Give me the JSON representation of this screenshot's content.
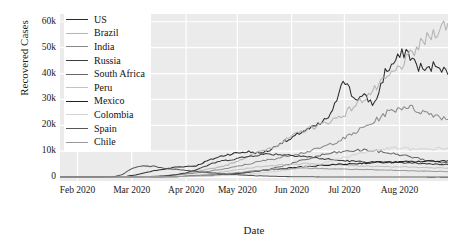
{
  "chart_data": {
    "type": "line",
    "title": "",
    "xlabel": "Date",
    "ylabel": "Recovered Cases",
    "grid": true,
    "legend_position": "upper-left-inside",
    "xlim": [
      "2020-01-22",
      "2020-08-28"
    ],
    "ylim": [
      -1500,
      63000
    ],
    "yticks": [
      0,
      10000,
      20000,
      30000,
      40000,
      50000,
      60000
    ],
    "ytick_labels": [
      "0",
      "10k",
      "20k",
      "30k",
      "40k",
      "50k",
      "60k"
    ],
    "xticks": [
      "Feb 2020",
      "Mar 2020",
      "Apr 2020",
      "May 2020",
      "Jun 2020",
      "Jul 2020",
      "Aug 2020"
    ],
    "x": [
      "2020-01-22",
      "2020-02-01",
      "2020-02-11",
      "2020-02-21",
      "2020-03-02",
      "2020-03-12",
      "2020-03-22",
      "2020-04-01",
      "2020-04-06",
      "2020-04-11",
      "2020-04-16",
      "2020-04-21",
      "2020-04-26",
      "2020-05-01",
      "2020-05-06",
      "2020-05-11",
      "2020-05-16",
      "2020-05-21",
      "2020-05-26",
      "2020-05-31",
      "2020-06-05",
      "2020-06-10",
      "2020-06-15",
      "2020-06-20",
      "2020-06-25",
      "2020-06-30",
      "2020-07-05",
      "2020-07-10",
      "2020-07-15",
      "2020-07-20",
      "2020-07-25",
      "2020-07-30",
      "2020-08-04",
      "2020-08-09",
      "2020-08-14",
      "2020-08-19",
      "2020-08-24",
      "2020-08-28"
    ],
    "series": [
      {
        "name": "US",
        "color": "#2b2b2b",
        "values": [
          0,
          0,
          0,
          0,
          0,
          0,
          100,
          700,
          1600,
          2500,
          3100,
          3900,
          4100,
          4400,
          6200,
          7600,
          8800,
          9400,
          9800,
          9200,
          10400,
          13200,
          14500,
          17500,
          18900,
          21000,
          24900,
          38800,
          30500,
          30900,
          28200,
          40500,
          44800,
          48900,
          43200,
          41000,
          44200,
          39500
        ]
      },
      {
        "name": "Brazil",
        "color": "#b4b4b4",
        "values": [
          0,
          0,
          0,
          0,
          0,
          0,
          0,
          50,
          120,
          250,
          400,
          900,
          1400,
          2100,
          2900,
          3800,
          4700,
          6400,
          8100,
          9800,
          11200,
          13000,
          15400,
          17500,
          19200,
          20400,
          22100,
          24000,
          27300,
          30500,
          33800,
          37500,
          41000,
          45000,
          49500,
          53500,
          57000,
          59500
        ]
      },
      {
        "name": "India",
        "color": "#8a8a8a",
        "values": [
          0,
          0,
          0,
          0,
          0,
          0,
          10,
          60,
          180,
          350,
          600,
          900,
          1200,
          1600,
          2100,
          2800,
          3400,
          4200,
          5100,
          6000,
          6800,
          7500,
          8600,
          9300,
          10200,
          11500,
          13100,
          14700,
          16900,
          19200,
          21500,
          24500,
          26200,
          27500,
          25900,
          24800,
          23900,
          22200
        ]
      },
      {
        "name": "Russia",
        "color": "#3c3c3c",
        "values": [
          0,
          0,
          0,
          0,
          0,
          0,
          0,
          20,
          80,
          180,
          400,
          900,
          1700,
          2900,
          4400,
          5900,
          6600,
          7300,
          8000,
          8700,
          8900,
          8800,
          8500,
          8200,
          7700,
          7100,
          6700,
          6400,
          6100,
          5900,
          5800,
          5700,
          5600,
          5500,
          5400,
          5200,
          5000,
          4800
        ]
      },
      {
        "name": "South Africa",
        "color": "#666666",
        "values": [
          0,
          0,
          0,
          0,
          0,
          0,
          0,
          5,
          20,
          50,
          100,
          180,
          260,
          350,
          520,
          720,
          950,
          1300,
          1800,
          2400,
          3100,
          4100,
          5200,
          6300,
          7400,
          8600,
          9300,
          9800,
          10200,
          10500,
          10100,
          9500,
          8900,
          8200,
          7400,
          6500,
          5900,
          5400
        ]
      },
      {
        "name": "Peru",
        "color": "#c2c2c2",
        "values": [
          0,
          0,
          0,
          0,
          0,
          0,
          0,
          10,
          40,
          90,
          170,
          300,
          500,
          800,
          1200,
          1700,
          2300,
          2900,
          3500,
          4000,
          4400,
          4700,
          4900,
          5100,
          5200,
          5000,
          4800,
          4600,
          4400,
          4300,
          4200,
          4100,
          4000,
          3900,
          3800,
          3700,
          3600,
          3500
        ]
      },
      {
        "name": "Mexico",
        "color": "#1f1f1f",
        "values": [
          0,
          0,
          0,
          0,
          0,
          0,
          0,
          5,
          25,
          60,
          120,
          200,
          320,
          480,
          700,
          950,
          1250,
          1600,
          2000,
          2400,
          2800,
          3200,
          3600,
          3900,
          4200,
          4500,
          4800,
          5000,
          5200,
          5400,
          5600,
          5700,
          5800,
          5900,
          6000,
          6100,
          6200,
          6300
        ]
      },
      {
        "name": "Colombia",
        "color": "#d4d4d4",
        "values": [
          0,
          0,
          0,
          0,
          0,
          0,
          0,
          2,
          10,
          25,
          55,
          100,
          170,
          260,
          380,
          520,
          700,
          920,
          1200,
          1500,
          1900,
          2400,
          3000,
          3700,
          4500,
          5400,
          6400,
          7500,
          8600,
          9600,
          10400,
          10900,
          11200,
          11000,
          10600,
          10800,
          11000,
          11200
        ]
      },
      {
        "name": "Spain",
        "color": "#555555",
        "values": [
          0,
          0,
          0,
          0,
          0,
          30,
          1100,
          3700,
          4300,
          4100,
          3500,
          3000,
          2600,
          2200,
          1800,
          1500,
          1200,
          900,
          700,
          500,
          350,
          250,
          180,
          140,
          110,
          90,
          70,
          60,
          50,
          45,
          40,
          35,
          30,
          28,
          25,
          22,
          20,
          18
        ]
      },
      {
        "name": "Chile",
        "color": "#9a9a9a",
        "values": [
          0,
          0,
          0,
          0,
          0,
          0,
          0,
          5,
          20,
          50,
          110,
          210,
          350,
          520,
          750,
          1050,
          1400,
          1800,
          2200,
          2600,
          2900,
          3100,
          3300,
          3400,
          3400,
          3300,
          3200,
          3100,
          3000,
          2900,
          2800,
          2700,
          2600,
          2500,
          2400,
          2300,
          2200,
          2100
        ]
      }
    ]
  },
  "legend": {
    "entries": [
      {
        "label": "US"
      },
      {
        "label": "Brazil"
      },
      {
        "label": "India"
      },
      {
        "label": "Russia"
      },
      {
        "label": "South Africa"
      },
      {
        "label": "Peru"
      },
      {
        "label": "Mexico"
      },
      {
        "label": "Colombia"
      },
      {
        "label": "Spain"
      },
      {
        "label": "Chile"
      }
    ]
  },
  "style": {
    "plot_background": "#ebebeb",
    "grid_color": "#ffffff",
    "text_color": "#1a1a1a"
  }
}
